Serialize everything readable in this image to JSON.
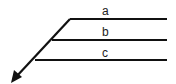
{
  "diagram": {
    "labels": {
      "a": "a",
      "b": "b",
      "c": "c"
    },
    "colors": {
      "stroke": "#111111",
      "background": "#ffffff"
    }
  }
}
